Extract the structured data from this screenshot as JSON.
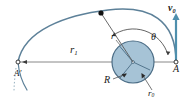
{
  "figure": {
    "colors": {
      "trajectory": "#5d8199",
      "disk_fill": "#a6c3d6",
      "disk_stroke": "#4a6c85",
      "vector": "#4e8fad",
      "leader": "#555555",
      "axis": "#777777",
      "point": "#111111",
      "text": "#1a1a1a"
    },
    "labels": {
      "r1": {
        "base": "r",
        "sub": "1"
      },
      "r": {
        "base": "r",
        "sub": ""
      },
      "theta": {
        "base": "θ",
        "sub": ""
      },
      "v0": {
        "base": "v",
        "sub": "0"
      },
      "A": {
        "base": "A",
        "sub": ""
      },
      "A_prime": {
        "base": "A′",
        "sub": ""
      },
      "R": {
        "base": "R",
        "sub": ""
      },
      "r0": {
        "base": "r",
        "sub": "0"
      }
    }
  }
}
